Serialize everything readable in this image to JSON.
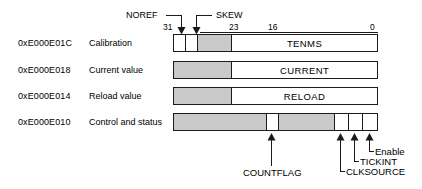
{
  "diagram": {
    "colors": {
      "reserved_fill": "#c9c9c9",
      "line": "#1a1a1a",
      "background": "#ffffff"
    },
    "bit_axis": {
      "ticks": [
        {
          "label": "31",
          "bit": 31
        },
        {
          "label": "23",
          "bit": 23
        },
        {
          "label": "16",
          "bit": 16
        },
        {
          "label": "0",
          "bit": 0
        }
      ]
    },
    "top_callouts": [
      {
        "name": "NOREF",
        "label": "NOREF",
        "bit": 31
      },
      {
        "name": "SKEW",
        "label": "SKEW",
        "bit": 30
      }
    ],
    "registers": [
      {
        "address": "0xE000E01C",
        "name": "Calibration",
        "fields": [
          {
            "label": "",
            "kind": "bit",
            "bits": "31"
          },
          {
            "label": "",
            "kind": "bit",
            "bits": "30"
          },
          {
            "label": "",
            "kind": "reserved",
            "bits": "29:24"
          },
          {
            "label": "TENMS",
            "kind": "field",
            "bits": "23:0"
          }
        ]
      },
      {
        "address": "0xE000E018",
        "name": "Current value",
        "fields": [
          {
            "label": "",
            "kind": "reserved",
            "bits": "31:24"
          },
          {
            "label": "CURRENT",
            "kind": "field",
            "bits": "23:0"
          }
        ]
      },
      {
        "address": "0xE000E014",
        "name": "Reload value",
        "fields": [
          {
            "label": "",
            "kind": "reserved",
            "bits": "31:24"
          },
          {
            "label": "RELOAD",
            "kind": "field",
            "bits": "23:0"
          }
        ]
      },
      {
        "address": "0xE000E010",
        "name": "Control and status",
        "fields": [
          {
            "label": "",
            "kind": "reserved",
            "bits": "31:17"
          },
          {
            "label": "COUNTFLAG",
            "kind": "bit",
            "bits": "16"
          },
          {
            "label": "",
            "kind": "reserved",
            "bits": "15:3"
          },
          {
            "label": "CLKSOURCE",
            "kind": "bit",
            "bits": "2"
          },
          {
            "label": "TICKINT",
            "kind": "bit",
            "bits": "1"
          },
          {
            "label": "Enable",
            "kind": "bit",
            "bits": "0"
          }
        ]
      }
    ],
    "bottom_callouts": [
      {
        "name": "COUNTFLAG",
        "label": "COUNTFLAG",
        "bit": 16
      },
      {
        "name": "CLKSOURCE",
        "label": "CLKSOURCE",
        "bit": 2
      },
      {
        "name": "TICKINT",
        "label": "TICKINT",
        "bit": 1
      },
      {
        "name": "Enable",
        "label": "Enable",
        "bit": 0
      }
    ]
  }
}
